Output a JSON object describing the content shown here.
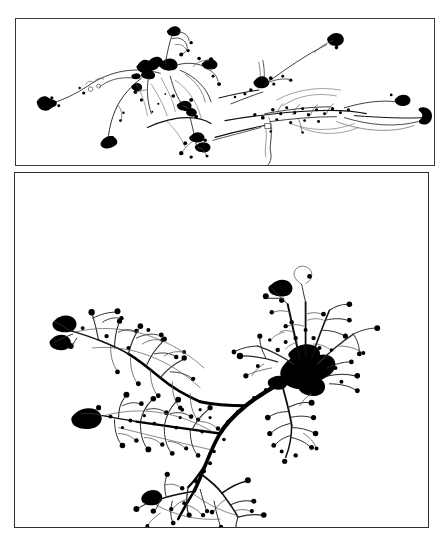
{
  "plate": {
    "title": "Botanical specimen plate",
    "background_color": "#ffffff",
    "ink_color": "#000000",
    "border_color": "#2e2e2e",
    "panel_count": 2,
    "caption": ""
  },
  "panels": [
    {
      "id": "panel-top",
      "name": "upper-panel",
      "x": 15,
      "y": 18,
      "width": 420,
      "height": 148,
      "border_color": "#3a3a3a",
      "border_width": 1,
      "specimen_count": 2,
      "specimens": [
        {
          "id": "specimen-top-left",
          "name": "sprawling-branched-specimen",
          "description": "Diffuse branching inflorescence with long arcing stems and dense dark seed clusters concentrated near center",
          "orientation": "sprawling",
          "terminal_node_count": 46
        },
        {
          "id": "specimen-top-right",
          "name": "horizontal-branched-specimen",
          "description": "Horizontally spreading inflorescence with elongate arcing stems and arrow-shaped terminal seed heads at right",
          "orientation": "horizontal",
          "terminal_node_count": 38
        }
      ]
    },
    {
      "id": "panel-bottom",
      "name": "lower-panel",
      "x": 14,
      "y": 172,
      "width": 415,
      "height": 356,
      "border_color": "#2e2e2e",
      "border_width": 1,
      "specimen_count": 1,
      "specimens": [
        {
          "id": "specimen-bottom",
          "name": "radiating-branched-specimen",
          "description": "Large panicle radiating from a dense dark central hub at upper right; three principal branch systems extend to upper left, left and lower centre, each bearing numerous small black terminal seed nodes",
          "orientation": "radiating",
          "terminal_node_count": 140,
          "main_branch_labels": [
            "upper-left-branch",
            "left-branch",
            "lower-branch",
            "right-branch",
            "upper-branch"
          ]
        }
      ]
    }
  ],
  "chart_data": {
    "type": "scatter",
    "xlabel": "",
    "ylabel": ""
  }
}
